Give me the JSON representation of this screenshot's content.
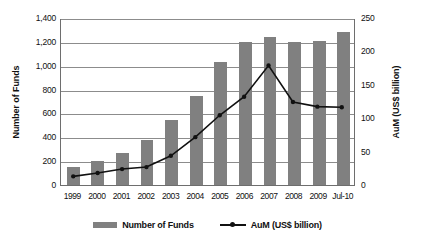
{
  "chart_data": {
    "type": "bar",
    "title": "",
    "subtitle": "",
    "categories": [
      "1999",
      "2000",
      "2001",
      "2002",
      "2003",
      "2004",
      "2005",
      "2006",
      "2007",
      "2008",
      "2009",
      "Jul-10"
    ],
    "xlabel": "",
    "ylabel": "Number of Funds",
    "ylabel_right": "AuM (US$ billion)",
    "ylim": [
      0,
      1400
    ],
    "ylim_right": [
      0,
      250
    ],
    "yticks": [
      "0",
      "200",
      "400",
      "600",
      "800",
      "1,000",
      "1,200",
      "1,400"
    ],
    "ytick_values": [
      0,
      200,
      400,
      600,
      800,
      1000,
      1200,
      1400
    ],
    "yticks_right": [
      "0",
      "50",
      "100",
      "150",
      "200",
      "250"
    ],
    "ytick_values_right": [
      0,
      50,
      100,
      150,
      200,
      250
    ],
    "grid": true,
    "legend_position": "bottom",
    "series": [
      {
        "name": "Number of Funds",
        "type": "bar",
        "axis": "left",
        "color": "#808080",
        "values": [
          150,
          200,
          270,
          380,
          545,
          750,
          1030,
          1195,
          1245,
          1200,
          1205,
          1285
        ]
      },
      {
        "name": "AuM (US$ billion)",
        "type": "line",
        "axis": "right",
        "color": "#111111",
        "marker": "circle",
        "values": [
          13,
          18,
          24,
          27,
          44,
          72,
          105,
          133,
          180,
          125,
          118,
          117
        ]
      }
    ]
  },
  "legend": {
    "items": [
      {
        "label": "Number of Funds",
        "marker": "bar-swatch"
      },
      {
        "label": "AuM (US$ billion)",
        "marker": "line-marker-swatch"
      }
    ]
  }
}
